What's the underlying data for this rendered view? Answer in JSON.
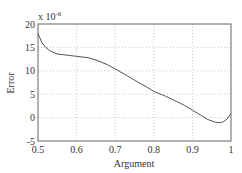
{
  "chart_data": {
    "type": "line",
    "title": "",
    "xlabel": "Argument",
    "ylabel": "Error",
    "y_multiplier": "x 10^-6",
    "xlim": [
      0.5,
      1.0
    ],
    "ylim": [
      -5,
      20
    ],
    "xticks": [
      0.5,
      0.6,
      0.7,
      0.8,
      0.9,
      1
    ],
    "yticks": [
      -5,
      0,
      5,
      10,
      15,
      20
    ],
    "grid": true,
    "series": [
      {
        "name": "Error",
        "color": "#555555",
        "x": [
          0.5,
          0.51,
          0.52,
          0.53,
          0.55,
          0.58,
          0.6,
          0.63,
          0.65,
          0.68,
          0.7,
          0.73,
          0.75,
          0.78,
          0.8,
          0.83,
          0.85,
          0.88,
          0.9,
          0.92,
          0.94,
          0.96,
          0.97,
          0.98,
          0.99,
          1.0
        ],
        "values": [
          18,
          16,
          15,
          14.3,
          13.6,
          13.3,
          13.1,
          12.8,
          12.3,
          11.3,
          10.4,
          9,
          8,
          6.6,
          5.6,
          4.6,
          3.8,
          2.6,
          1.6,
          0.6,
          -0.4,
          -1,
          -1.1,
          -0.9,
          -0.3,
          0.9
        ]
      }
    ]
  },
  "axes": {
    "x_label": "Argument",
    "y_label": "Error",
    "exponent_label": "x 10",
    "exponent_power": "-6",
    "x_tick_labels": [
      "0.5",
      "0.6",
      "0.7",
      "0.8",
      "0.9",
      "1"
    ],
    "y_tick_labels": [
      "20",
      "15",
      "10",
      "5",
      "0",
      "-5"
    ]
  }
}
